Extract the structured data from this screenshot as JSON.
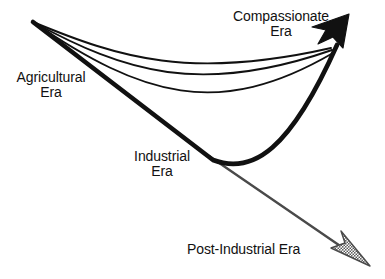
{
  "diagram": {
    "type": "trajectory-arrow-diagram",
    "background_color": "#ffffff",
    "stroke_color": "#111111",
    "secondary_stroke_color": "#4a4a4a",
    "arrowhead_solid_color": "#111111",
    "arrowhead_hatched_color": "#6e6e6e",
    "labels": {
      "agricultural": {
        "line1": "Agricultural",
        "line2": "Era"
      },
      "compassionate": {
        "line1": "Compassionate",
        "line2": "Era"
      },
      "industrial": {
        "line1": "Industrial",
        "line2": "Era"
      },
      "post_industrial": {
        "line1": "Post-Industrial Era"
      }
    },
    "nodes": {
      "origin": {
        "x": 33,
        "y": 22
      },
      "trough": {
        "x": 212,
        "y": 159
      },
      "upper_target": {
        "x": 341,
        "y": 38
      },
      "lower_target": {
        "x": 355,
        "y": 258
      }
    },
    "paths": {
      "main_descent": "M33,22 L212,159",
      "main_ascent": "M212,159 C252,173 288,150 336,44",
      "recovery_curve_1": "M33,22 C120,58 190,80 331,48",
      "recovery_curve_2": "M33,22 C125,70 200,95 332,50",
      "recovery_curve_3": "M33,22 C140,92 215,118 333,52",
      "post_industrial_line": "M211,158 L350,253"
    }
  }
}
